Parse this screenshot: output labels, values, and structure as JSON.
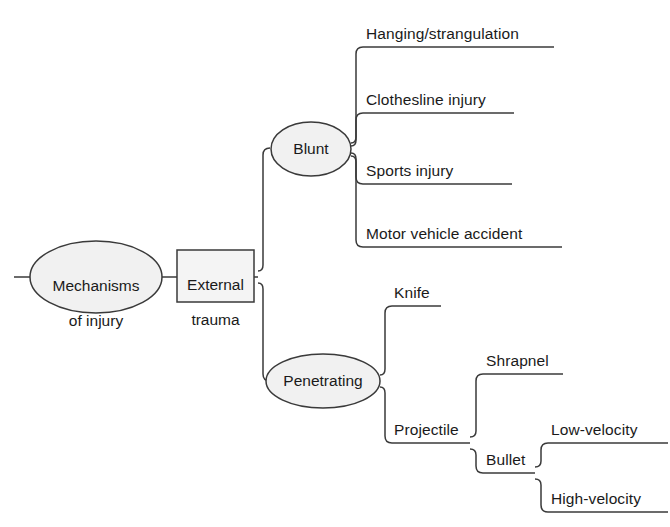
{
  "diagram": {
    "title": "Mechanisms of injury",
    "type": "mind-map",
    "palette": {
      "stroke": "#3a3a3a",
      "ellipse_fill": "#f1f1f1",
      "box_fill": "#f4f4f4",
      "text": "#1a1a1a",
      "background": "#ffffff"
    },
    "root": {
      "label_line1": "Mechanisms",
      "label_line2": "of injury",
      "shape": "ellipse"
    },
    "trunk": {
      "label_line1": "External",
      "label_line2": "trauma",
      "shape": "rectangle"
    },
    "branches": [
      {
        "label": "Blunt",
        "shape": "ellipse",
        "children": [
          {
            "label": "Hanging/strangulation",
            "shape": "underline"
          },
          {
            "label": "Clothesline injury",
            "shape": "underline"
          },
          {
            "label": "Sports injury",
            "shape": "underline"
          },
          {
            "label": "Motor vehicle accident",
            "shape": "underline"
          }
        ]
      },
      {
        "label": "Penetrating",
        "shape": "ellipse",
        "children": [
          {
            "label": "Knife",
            "shape": "underline",
            "children": []
          },
          {
            "label": "Projectile",
            "shape": "underline",
            "children": [
              {
                "label": "Shrapnel",
                "shape": "underline",
                "children": []
              },
              {
                "label": "Bullet",
                "shape": "underline",
                "children": [
                  {
                    "label": "Low-velocity",
                    "shape": "underline"
                  },
                  {
                    "label": "High-velocity",
                    "shape": "underline"
                  }
                ]
              }
            ]
          }
        ]
      }
    ]
  }
}
